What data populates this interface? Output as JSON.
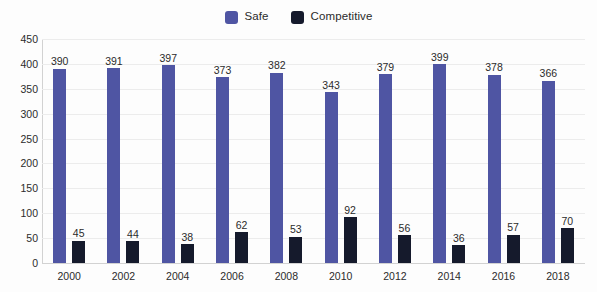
{
  "chart_data": {
    "type": "bar",
    "title": "",
    "subtitle": "",
    "xlabel": "",
    "ylabel": "",
    "ylim": [
      0,
      450
    ],
    "yticks": [
      0,
      50,
      100,
      150,
      200,
      250,
      300,
      350,
      400,
      450
    ],
    "grid": true,
    "legend_position": "top-center",
    "data_labels": true,
    "categories": [
      "2000",
      "2002",
      "2004",
      "2006",
      "2008",
      "2010",
      "2012",
      "2014",
      "2016",
      "2018"
    ],
    "series": [
      {
        "name": "Safe",
        "color": "#4f55a3",
        "values": [
          390,
          391,
          397,
          373,
          382,
          343,
          379,
          399,
          378,
          366
        ]
      },
      {
        "name": "Competitive",
        "color": "#151a2c",
        "values": [
          45,
          44,
          38,
          62,
          53,
          92,
          56,
          36,
          57,
          70
        ]
      }
    ]
  },
  "colors": {
    "safe": "#4f55a3",
    "competitive": "#151a2c",
    "gridline": "#ececec",
    "axis": "#d2d2d2",
    "text": "#2b2b2b",
    "background": "#fdfdfd"
  }
}
